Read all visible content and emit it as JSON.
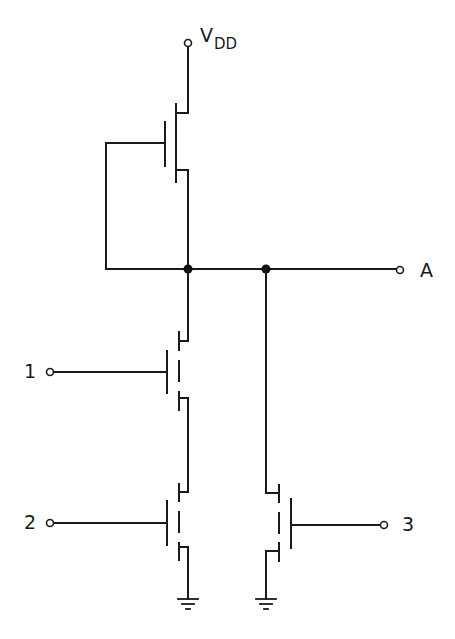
{
  "diagram": {
    "type": "nmos-logic-circuit",
    "supply": {
      "label_main": "V",
      "label_sub": "DD"
    },
    "output": {
      "label": "A"
    },
    "inputs": [
      {
        "label": "1"
      },
      {
        "label": "2"
      },
      {
        "label": "3"
      }
    ],
    "components": [
      {
        "name": "load-transistor",
        "type": "depletion-nmos",
        "gate": "tied-to-source"
      },
      {
        "name": "transistor-1",
        "type": "enhancement-nmos",
        "gate_input": "1"
      },
      {
        "name": "transistor-2",
        "type": "enhancement-nmos",
        "gate_input": "2"
      },
      {
        "name": "transistor-3",
        "type": "enhancement-nmos",
        "gate_input": "3"
      }
    ],
    "grounds": 2,
    "junctions": 2,
    "colors": {
      "line": "#1a1a1a",
      "background": "#ffffff"
    }
  }
}
